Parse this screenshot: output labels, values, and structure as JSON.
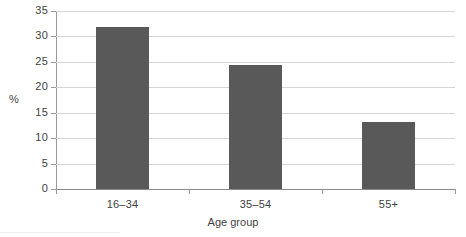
{
  "chart_data": {
    "type": "bar",
    "title": "",
    "subtitle": "",
    "categories": [
      "16–34",
      "35–54",
      "55+"
    ],
    "values": [
      31.8,
      24.3,
      13.1
    ],
    "series": [
      {
        "name": "",
        "values": [
          31.8,
          24.3,
          13.1
        ]
      }
    ],
    "xlabel": "Age group",
    "ylabel": "%",
    "ylim": [
      0,
      35
    ],
    "yticks": [
      0,
      5,
      10,
      15,
      20,
      25,
      30,
      35
    ],
    "ytick_labels": [
      "0",
      "5",
      "10",
      "15",
      "20",
      "25",
      "30",
      "35"
    ],
    "grid": "horizontal",
    "legend": "none",
    "annotations": [],
    "colors": {
      "bar": "#595959",
      "gridline": "#d4d4d4",
      "axis": "#9a9a9a",
      "baseline": "#8a8a8a",
      "text": "#3f3f3f",
      "background": "#ffffff"
    }
  },
  "axes": {
    "y": {
      "title": "%",
      "ticks": [
        {
          "label": "35",
          "value": 35
        },
        {
          "label": "30",
          "value": 30
        },
        {
          "label": "25",
          "value": 25
        },
        {
          "label": "20",
          "value": 20
        },
        {
          "label": "15",
          "value": 15
        },
        {
          "label": "10",
          "value": 10
        },
        {
          "label": "5",
          "value": 5
        },
        {
          "label": "0",
          "value": 0
        }
      ]
    },
    "x": {
      "title": "Age group",
      "ticks": [
        {
          "label": "16–34"
        },
        {
          "label": "35–54"
        },
        {
          "label": "55+"
        }
      ]
    }
  }
}
